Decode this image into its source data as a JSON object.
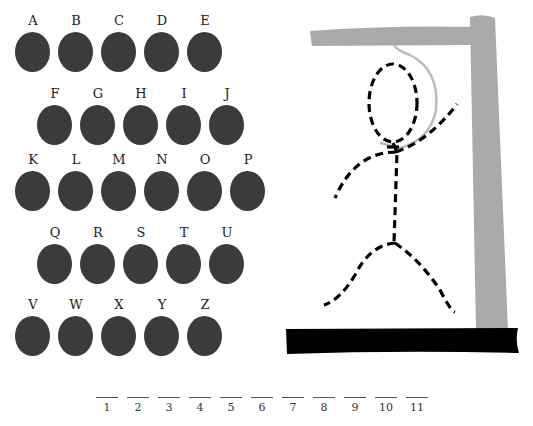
{
  "keyboard": {
    "rows": [
      {
        "offset_x": 15,
        "top": 13,
        "letters": [
          "A",
          "B",
          "C",
          "D",
          "E"
        ]
      },
      {
        "offset_x": 37,
        "top": 86,
        "letters": [
          "F",
          "G",
          "H",
          "I",
          "J"
        ]
      },
      {
        "offset_x": 15,
        "top": 152,
        "letters": [
          "K",
          "L",
          "M",
          "N",
          "O",
          "P"
        ]
      },
      {
        "offset_x": 37,
        "top": 225,
        "letters": [
          "Q",
          "R",
          "S",
          "T",
          "U"
        ]
      },
      {
        "offset_x": 15,
        "top": 297,
        "letters": [
          "V",
          "W",
          "X",
          "Y",
          "Z"
        ]
      }
    ],
    "key_spacing": 43,
    "ball_color": "#3b3b3b"
  },
  "word_blanks": {
    "count": 11,
    "labels": [
      "1",
      "2",
      "3",
      "4",
      "5",
      "6",
      "7",
      "8",
      "9",
      "10",
      "11"
    ],
    "start_x": 96,
    "spacing": 31
  },
  "hangman": {
    "gallows_color": "#aaaaaa",
    "base_color": "#000000",
    "rope_color": "#bbbbbb",
    "figure_style": "dashed",
    "parts_shown": [
      "head",
      "body",
      "left-arm",
      "right-arm",
      "left-leg",
      "right-leg"
    ]
  }
}
